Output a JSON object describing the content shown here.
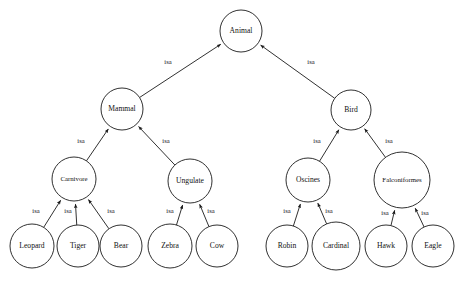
{
  "figure": {
    "caption": "",
    "background_color": "#ffffff",
    "line_color": "#1a1a1a",
    "text_color": "#111111"
  },
  "chart_data": {
    "type": "diagram",
    "diagram_kind": "semantic-network-tree",
    "edge_label_default": "isa",
    "nodes": [
      {
        "id": "animal",
        "label": "Animal",
        "cx": 241,
        "cy": 31,
        "r": 21,
        "level": 0
      },
      {
        "id": "mammal",
        "label": "Mammal",
        "cx": 122,
        "cy": 109,
        "r": 21,
        "level": 1
      },
      {
        "id": "bird",
        "label": "Bird",
        "cx": 351,
        "cy": 110,
        "r": 20,
        "level": 1
      },
      {
        "id": "carnivore",
        "label": "Carnivore",
        "cx": 74,
        "cy": 179,
        "r": 22,
        "level": 2
      },
      {
        "id": "ungulate",
        "label": "Ungulate",
        "cx": 190,
        "cy": 181,
        "r": 22,
        "level": 2
      },
      {
        "id": "oscines",
        "label": "Oscines",
        "cx": 308,
        "cy": 180,
        "r": 22,
        "level": 2
      },
      {
        "id": "falconiformes",
        "label": "Falconiformes",
        "cx": 402,
        "cy": 180,
        "r": 28,
        "level": 2
      },
      {
        "id": "leopard",
        "label": "Leopard",
        "cx": 32,
        "cy": 246,
        "r": 22,
        "level": 3
      },
      {
        "id": "tiger",
        "label": "Tiger",
        "cx": 78,
        "cy": 246,
        "r": 21,
        "level": 3
      },
      {
        "id": "bear",
        "label": "Bear",
        "cx": 121,
        "cy": 246,
        "r": 21,
        "level": 3
      },
      {
        "id": "zebra",
        "label": "Zebra",
        "cx": 170,
        "cy": 246,
        "r": 22,
        "level": 3
      },
      {
        "id": "cow",
        "label": "Cow",
        "cx": 217,
        "cy": 246,
        "r": 21,
        "level": 3
      },
      {
        "id": "robin",
        "label": "Robin",
        "cx": 287,
        "cy": 246,
        "r": 21,
        "level": 3
      },
      {
        "id": "cardinal",
        "label": "Cardinal",
        "cx": 336,
        "cy": 246,
        "r": 24,
        "level": 3
      },
      {
        "id": "hawk",
        "label": "Hawk",
        "cx": 386,
        "cy": 246,
        "r": 21,
        "level": 3
      },
      {
        "id": "eagle",
        "label": "Eagle",
        "cx": 433,
        "cy": 246,
        "r": 21,
        "level": 3
      }
    ],
    "edges": [
      {
        "from": "mammal",
        "to": "animal",
        "label": "isa",
        "label_x": 168,
        "label_y": 62
      },
      {
        "from": "bird",
        "to": "animal",
        "label": "isa",
        "label_x": 311,
        "label_y": 62
      },
      {
        "from": "carnivore",
        "to": "mammal",
        "label": "isa",
        "label_x": 81,
        "label_y": 141
      },
      {
        "from": "ungulate",
        "to": "mammal",
        "label": "isa",
        "label_x": 166,
        "label_y": 141
      },
      {
        "from": "oscines",
        "to": "bird",
        "label": "isa",
        "label_x": 317,
        "label_y": 141
      },
      {
        "from": "falconiformes",
        "to": "bird",
        "label": "isa",
        "label_x": 389,
        "label_y": 141
      },
      {
        "from": "leopard",
        "to": "carnivore",
        "label": "isa",
        "label_x": 36,
        "label_y": 211
      },
      {
        "from": "tiger",
        "to": "carnivore",
        "label": "isa",
        "label_x": 68,
        "label_y": 211
      },
      {
        "from": "bear",
        "to": "carnivore",
        "label": "isa",
        "label_x": 111,
        "label_y": 211
      },
      {
        "from": "zebra",
        "to": "ungulate",
        "label": "isa",
        "label_x": 170,
        "label_y": 211
      },
      {
        "from": "cow",
        "to": "ungulate",
        "label": "isa",
        "label_x": 211,
        "label_y": 211
      },
      {
        "from": "robin",
        "to": "oscines",
        "label": "isa",
        "label_x": 287,
        "label_y": 211
      },
      {
        "from": "cardinal",
        "to": "oscines",
        "label": "isa",
        "label_x": 329,
        "label_y": 211
      },
      {
        "from": "hawk",
        "to": "falconiformes",
        "label": "isa",
        "label_x": 385,
        "label_y": 213
      },
      {
        "from": "eagle",
        "to": "falconiformes",
        "label": "isa",
        "label_x": 425,
        "label_y": 213
      }
    ]
  }
}
